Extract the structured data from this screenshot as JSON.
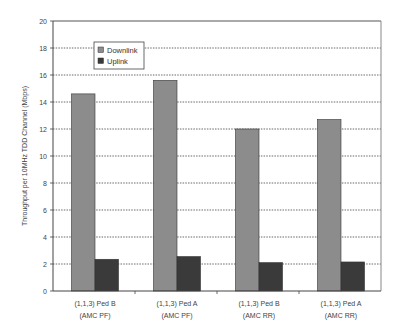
{
  "chart_data": {
    "type": "bar",
    "title": "",
    "xlabel": "",
    "ylabel": "Throughput per 10MHz TDD Channel (Mbps)",
    "ylim": [
      0,
      20
    ],
    "yticks": [
      0,
      2,
      4,
      6,
      8,
      10,
      12,
      14,
      16,
      18,
      20
    ],
    "grid": true,
    "grid_style": "dotted horizontal",
    "legend_position": "upper-left inside plot",
    "categories": [
      [
        "(1,1,3) Ped B",
        "(AMC PF)"
      ],
      [
        "(1,1,3) Ped A",
        "(AMC PF)"
      ],
      [
        "(1,1,3) Ped B",
        "(AMC RR)"
      ],
      [
        "(1,1,3) Ped A",
        "(AMC RR)"
      ]
    ],
    "series": [
      {
        "name": "Downlink",
        "color": "#8c8c8c",
        "values": [
          14.6,
          15.6,
          12.0,
          12.7
        ]
      },
      {
        "name": "Uplink",
        "color": "#3a3a3a",
        "values": [
          2.35,
          2.55,
          2.1,
          2.15
        ]
      }
    ]
  }
}
